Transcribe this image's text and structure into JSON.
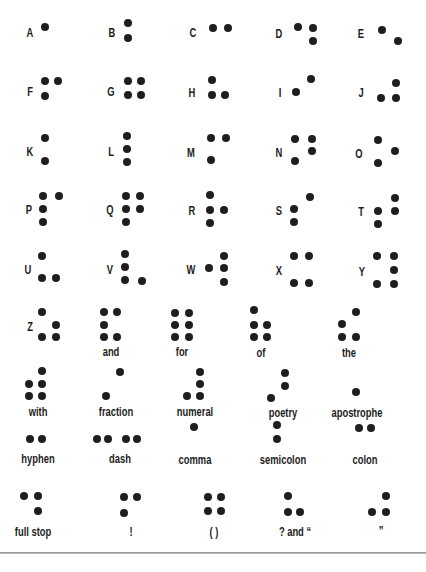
{
  "colors": {
    "dot": "#1e1e1e",
    "text": "#1c1c1c",
    "background": "#ffffff",
    "rule": "#8a8a8a"
  },
  "cells": [
    {
      "label": "A",
      "lx": 30,
      "ly": 33,
      "dots": [
        [
          45,
          27
        ]
      ]
    },
    {
      "label": "B",
      "lx": 112,
      "ly": 33,
      "dots": [
        [
          128,
          23
        ],
        [
          128,
          38
        ]
      ]
    },
    {
      "label": "C",
      "lx": 193,
      "ly": 33,
      "dots": [
        [
          213,
          28
        ],
        [
          228,
          28
        ]
      ]
    },
    {
      "label": "D",
      "lx": 279,
      "ly": 34,
      "dots": [
        [
          298,
          27
        ],
        [
          313,
          28
        ],
        [
          313,
          41
        ]
      ]
    },
    {
      "label": "E",
      "lx": 361,
      "ly": 34,
      "dots": [
        [
          382,
          30
        ],
        [
          398,
          41
        ]
      ]
    },
    {
      "label": "F",
      "lx": 30,
      "ly": 92,
      "dots": [
        [
          45,
          81
        ],
        [
          58,
          81
        ],
        [
          45,
          96
        ]
      ]
    },
    {
      "label": "G",
      "lx": 111,
      "ly": 92,
      "dots": [
        [
          128,
          81
        ],
        [
          141,
          81
        ],
        [
          128,
          95
        ],
        [
          141,
          95
        ]
      ]
    },
    {
      "label": "H",
      "lx": 192,
      "ly": 93,
      "dots": [
        [
          212,
          80
        ],
        [
          212,
          95
        ],
        [
          225,
          95
        ]
      ]
    },
    {
      "label": "I",
      "lx": 280,
      "ly": 93,
      "dots": [
        [
          296,
          92
        ],
        [
          311,
          79
        ]
      ]
    },
    {
      "label": "J",
      "lx": 361,
      "ly": 93,
      "dots": [
        [
          396,
          83
        ],
        [
          381,
          98
        ],
        [
          396,
          98
        ]
      ]
    },
    {
      "label": "K",
      "lx": 30,
      "ly": 152,
      "dots": [
        [
          45,
          138
        ],
        [
          45,
          161
        ]
      ]
    },
    {
      "label": "L",
      "lx": 111,
      "ly": 152,
      "dots": [
        [
          127,
          136
        ],
        [
          127,
          149
        ],
        [
          127,
          162
        ]
      ]
    },
    {
      "label": "M",
      "lx": 191,
      "ly": 153,
      "dots": [
        [
          211,
          138
        ],
        [
          226,
          138
        ],
        [
          211,
          160
        ]
      ]
    },
    {
      "label": "N",
      "lx": 279,
      "ly": 153,
      "dots": [
        [
          295,
          139
        ],
        [
          312,
          139
        ],
        [
          312,
          151
        ],
        [
          295,
          161
        ]
      ]
    },
    {
      "label": "O",
      "lx": 359,
      "ly": 154,
      "dots": [
        [
          378,
          140
        ],
        [
          395,
          151
        ],
        [
          378,
          163
        ]
      ]
    },
    {
      "label": "P",
      "lx": 29,
      "ly": 210,
      "dots": [
        [
          43,
          196
        ],
        [
          59,
          196
        ],
        [
          43,
          209
        ],
        [
          43,
          222
        ]
      ]
    },
    {
      "label": "Q",
      "lx": 110,
      "ly": 210,
      "dots": [
        [
          126,
          196
        ],
        [
          140,
          196
        ],
        [
          126,
          209
        ],
        [
          140,
          209
        ],
        [
          126,
          222
        ]
      ]
    },
    {
      "label": "R",
      "lx": 192,
      "ly": 211,
      "dots": [
        [
          210,
          195
        ],
        [
          210,
          210
        ],
        [
          224,
          210
        ],
        [
          210,
          223
        ]
      ]
    },
    {
      "label": "S",
      "lx": 279,
      "ly": 211,
      "dots": [
        [
          310,
          197
        ],
        [
          294,
          209
        ],
        [
          294,
          222
        ]
      ]
    },
    {
      "label": "T",
      "lx": 361,
      "ly": 212,
      "dots": [
        [
          395,
          198
        ],
        [
          378,
          211
        ],
        [
          395,
          211
        ],
        [
          378,
          224
        ]
      ]
    },
    {
      "label": "U",
      "lx": 28,
      "ly": 270,
      "dots": [
        [
          42,
          256
        ],
        [
          42,
          278
        ],
        [
          56,
          278
        ]
      ]
    },
    {
      "label": "V",
      "lx": 110,
      "ly": 270,
      "dots": [
        [
          125,
          254
        ],
        [
          125,
          267
        ],
        [
          125,
          280
        ],
        [
          142,
          281
        ]
      ]
    },
    {
      "label": "W",
      "lx": 191,
      "ly": 270,
      "dots": [
        [
          209,
          268
        ],
        [
          224,
          256
        ],
        [
          224,
          268
        ],
        [
          224,
          282
        ]
      ]
    },
    {
      "label": "X",
      "lx": 279,
      "ly": 271,
      "dots": [
        [
          294,
          256
        ],
        [
          309,
          256
        ],
        [
          294,
          283
        ],
        [
          309,
          283
        ]
      ]
    },
    {
      "label": "Y",
      "lx": 362,
      "ly": 272,
      "dots": [
        [
          377,
          256
        ],
        [
          394,
          256
        ],
        [
          394,
          270
        ],
        [
          377,
          284
        ],
        [
          394,
          284
        ]
      ]
    },
    {
      "label": "Z",
      "lx": 30,
      "ly": 327,
      "dots": [
        [
          42,
          312
        ],
        [
          56,
          325
        ],
        [
          42,
          337
        ],
        [
          56,
          337
        ]
      ]
    },
    {
      "label": "and",
      "lx": 111,
      "ly": 352,
      "dots": [
        [
          104,
          312
        ],
        [
          117,
          312
        ],
        [
          104,
          325
        ],
        [
          104,
          337
        ],
        [
          117,
          337
        ]
      ]
    },
    {
      "label": "for",
      "lx": 182,
      "ly": 352,
      "dots": [
        [
          175,
          313
        ],
        [
          189,
          313
        ],
        [
          175,
          325
        ],
        [
          189,
          325
        ],
        [
          175,
          337
        ],
        [
          189,
          337
        ]
      ]
    },
    {
      "label": "of",
      "lx": 261,
      "ly": 353,
      "dots": [
        [
          254,
          310
        ],
        [
          254,
          325
        ],
        [
          267,
          325
        ],
        [
          254,
          337
        ],
        [
          267,
          337
        ]
      ]
    },
    {
      "label": "the",
      "lx": 349,
      "ly": 353,
      "dots": [
        [
          356,
          312
        ],
        [
          342,
          324
        ],
        [
          342,
          337
        ],
        [
          356,
          337
        ]
      ]
    },
    {
      "label": "with",
      "lx": 38,
      "ly": 412,
      "dots": [
        [
          42,
          371
        ],
        [
          29,
          384
        ],
        [
          42,
          384
        ],
        [
          29,
          396
        ],
        [
          42,
          396
        ]
      ]
    },
    {
      "label": "fraction",
      "lx": 116,
      "ly": 412,
      "dots": [
        [
          120,
          372
        ],
        [
          106,
          396
        ]
      ]
    },
    {
      "label": "numeral",
      "lx": 195,
      "ly": 412,
      "dots": [
        [
          200,
          372
        ],
        [
          200,
          384
        ],
        [
          187,
          396
        ],
        [
          200,
          396
        ]
      ]
    },
    {
      "label": "poetry",
      "lx": 283,
      "ly": 413,
      "dots": [
        [
          285,
          373
        ],
        [
          285,
          386
        ],
        [
          271,
          398
        ]
      ]
    },
    {
      "label": "apostrophe",
      "lx": 357,
      "ly": 413,
      "dots": [
        [
          356,
          392
        ]
      ]
    },
    {
      "label": "hyphen",
      "lx": 38,
      "ly": 459,
      "dots": [
        [
          30,
          439
        ],
        [
          42,
          439
        ]
      ]
    },
    {
      "label": "dash",
      "lx": 120,
      "ly": 459,
      "dots": [
        [
          97,
          439
        ],
        [
          108,
          439
        ],
        [
          126,
          439
        ],
        [
          137,
          439
        ]
      ]
    },
    {
      "label": "comma",
      "lx": 195,
      "ly": 460,
      "dots": [
        [
          194,
          427
        ]
      ]
    },
    {
      "label": "semicolon",
      "lx": 283,
      "ly": 460,
      "dots": [
        [
          277,
          425
        ],
        [
          277,
          439
        ]
      ]
    },
    {
      "label": "colon",
      "lx": 365,
      "ly": 460,
      "dots": [
        [
          359,
          428
        ],
        [
          371,
          428
        ]
      ]
    },
    {
      "label": "full stop",
      "lx": 33,
      "ly": 532,
      "dots": [
        [
          24,
          496
        ],
        [
          38,
          496
        ],
        [
          38,
          511
        ]
      ]
    },
    {
      "label": "!",
      "lx": 131,
      "ly": 532,
      "dots": [
        [
          124,
          497
        ],
        [
          137,
          497
        ],
        [
          124,
          513
        ]
      ]
    },
    {
      "label": "( )",
      "lx": 214,
      "ly": 532,
      "dots": [
        [
          208,
          497
        ],
        [
          221,
          497
        ],
        [
          208,
          511
        ],
        [
          221,
          511
        ]
      ]
    },
    {
      "label": "? and “",
      "lx": 295,
      "ly": 532,
      "dots": [
        [
          288,
          496
        ],
        [
          288,
          512
        ],
        [
          300,
          512
        ]
      ]
    },
    {
      "label": "”",
      "lx": 381,
      "ly": 531,
      "dots": [
        [
          386,
          496
        ],
        [
          372,
          512
        ],
        [
          386,
          512
        ]
      ]
    }
  ]
}
